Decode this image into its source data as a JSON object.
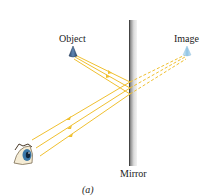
{
  "figure": {
    "caption": "(a)",
    "labels": {
      "object": "Object",
      "image": "Image",
      "mirror": "Mirror"
    },
    "colors": {
      "ray": "#f0c030",
      "mirror_dark": "#6a6a6a",
      "mirror_light": "#e8e8e8",
      "object": "#3a5f8a",
      "image": "#a9d4ee"
    },
    "elements": [
      "object",
      "image",
      "mirror",
      "eye",
      "reflected-rays",
      "virtual-rays"
    ]
  }
}
